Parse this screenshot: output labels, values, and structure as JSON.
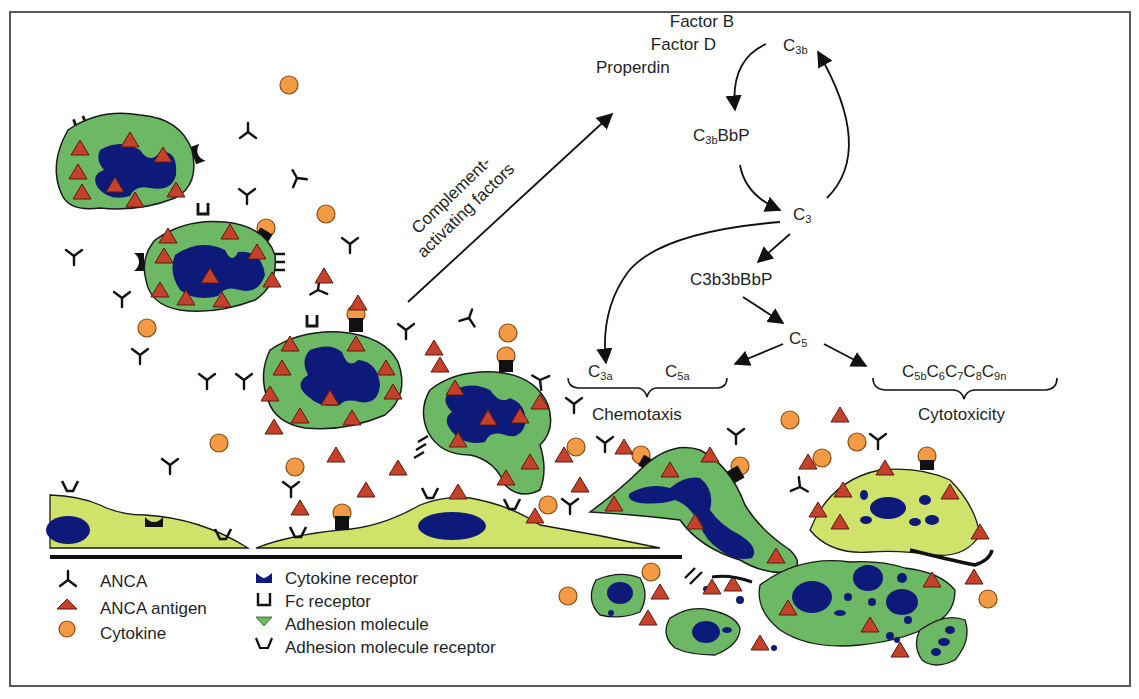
{
  "pathway": {
    "factors": [
      "Factor B",
      "Factor D",
      "Properdin"
    ],
    "arrow_label_line1": "Complement-",
    "arrow_label_line2": "activating factors",
    "nodes": {
      "c3b": {
        "base": "C",
        "sub": "3b"
      },
      "c3bbbp": {
        "base": "C",
        "sub": "3b",
        "suffix": "BbP"
      },
      "c3": {
        "base": "C",
        "sub": "3"
      },
      "c3b3bbbp": {
        "text": "C3b3bBbP"
      },
      "c5": {
        "base": "C",
        "sub": "5"
      },
      "c3a": {
        "base": "C",
        "sub": "3a"
      },
      "c5a": {
        "base": "C",
        "sub": "5a"
      },
      "mac": [
        {
          "base": "C",
          "sub": "5b"
        },
        {
          "base": "C",
          "sub": "6"
        },
        {
          "base": "C",
          "sub": "7"
        },
        {
          "base": "C",
          "sub": "8"
        },
        {
          "base": "C",
          "sub": "9n"
        }
      ]
    },
    "outcomes": {
      "chemotaxis": "Chemotaxis",
      "cytotoxicity": "Cytotoxicity"
    }
  },
  "legend": {
    "items": [
      {
        "icon": "anca-icon",
        "label": "ANCA"
      },
      {
        "icon": "anca-antigen-icon",
        "label": "ANCA antigen"
      },
      {
        "icon": "cytokine-icon",
        "label": "Cytokine"
      },
      {
        "icon": "cytokine-receptor-icon",
        "label": "Cytokine receptor"
      },
      {
        "icon": "fc-receptor-icon",
        "label": "Fc receptor"
      },
      {
        "icon": "adhesion-molecule-icon",
        "label": "Adhesion molecule"
      },
      {
        "icon": "adhesion-molecule-receptor-icon",
        "label": "Adhesion molecule receptor"
      }
    ]
  },
  "colors": {
    "neutrophil": "#6cb865",
    "endothelium": "#cfe36a",
    "nucleus": "#0e1a7a",
    "antigen": "#c5412a",
    "cytokine": "#f39a45",
    "outline": "#1a1a1a",
    "frame": "#5a5a5a"
  }
}
